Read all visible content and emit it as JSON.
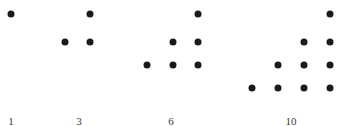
{
  "chart_data": {
    "type": "scatter",
    "title": "",
    "subtitle": "",
    "xlabel": "",
    "ylabel": "",
    "xlim": [
      0,
      342
    ],
    "ylim": [
      0,
      126
    ],
    "grid": false,
    "legend": null,
    "legend_position": "none",
    "marker": {
      "shape": "circle",
      "color": "#1a1a1a",
      "size_px": 7
    },
    "categories": [
      "1",
      "3",
      "6",
      "10"
    ],
    "values": [
      1,
      3,
      6,
      10
    ],
    "xticks": [
      {
        "label": "1",
        "x": 11
      },
      {
        "label": "3",
        "x": 79
      },
      {
        "label": "6",
        "x": 171
      },
      {
        "label": "10",
        "x": 291
      }
    ],
    "tick_label_y": 116,
    "row_y": [
      14,
      42,
      65,
      88
    ],
    "clusters": [
      {
        "name": "cluster-1",
        "label": "1",
        "count": 1,
        "rows": [
          1
        ],
        "points": [
          {
            "x": 11,
            "y": 14,
            "row": 0,
            "col": 0
          }
        ]
      },
      {
        "name": "cluster-3",
        "label": "3",
        "count": 3,
        "rows": [
          1,
          2
        ],
        "points": [
          {
            "x": 90,
            "y": 14,
            "row": 0,
            "col": 0
          },
          {
            "x": 65,
            "y": 42,
            "row": 1,
            "col": 0
          },
          {
            "x": 90,
            "y": 42,
            "row": 1,
            "col": 1
          }
        ]
      },
      {
        "name": "cluster-6",
        "label": "6",
        "count": 6,
        "rows": [
          1,
          2,
          3
        ],
        "points": [
          {
            "x": 198,
            "y": 14,
            "row": 0,
            "col": 0
          },
          {
            "x": 173,
            "y": 42,
            "row": 1,
            "col": 0
          },
          {
            "x": 198,
            "y": 42,
            "row": 1,
            "col": 1
          },
          {
            "x": 147,
            "y": 65,
            "row": 2,
            "col": 0
          },
          {
            "x": 173,
            "y": 65,
            "row": 2,
            "col": 1
          },
          {
            "x": 198,
            "y": 65,
            "row": 2,
            "col": 2
          }
        ]
      },
      {
        "name": "cluster-10",
        "label": "10",
        "count": 10,
        "rows": [
          1,
          2,
          3,
          4
        ],
        "points": [
          {
            "x": 330,
            "y": 14,
            "row": 0,
            "col": 0
          },
          {
            "x": 304,
            "y": 42,
            "row": 1,
            "col": 0
          },
          {
            "x": 330,
            "y": 42,
            "row": 1,
            "col": 1
          },
          {
            "x": 278,
            "y": 65,
            "row": 2,
            "col": 0
          },
          {
            "x": 304,
            "y": 65,
            "row": 2,
            "col": 1
          },
          {
            "x": 330,
            "y": 65,
            "row": 2,
            "col": 2
          },
          {
            "x": 252,
            "y": 88,
            "row": 3,
            "col": 0
          },
          {
            "x": 278,
            "y": 88,
            "row": 3,
            "col": 1
          },
          {
            "x": 304,
            "y": 88,
            "row": 3,
            "col": 2
          },
          {
            "x": 330,
            "y": 88,
            "row": 3,
            "col": 3
          }
        ]
      }
    ],
    "colors": {
      "dot": "#1a1a1a",
      "tick_label": "#3a3a3a",
      "background": "#ffffff"
    }
  }
}
